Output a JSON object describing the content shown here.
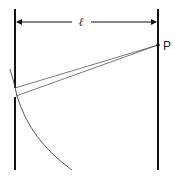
{
  "diagram": {
    "type": "single-slit diffraction geometry",
    "labels": {
      "distance": "ℓ",
      "point": "P"
    },
    "colors": {
      "lines": "#111111",
      "rays": "#555555",
      "arc": "#444444",
      "background": "#ffffff"
    },
    "elements": [
      "left wall with slit",
      "right screen",
      "distance arrow ℓ",
      "two rays from slit edges to P",
      "circular arc centered on P"
    ]
  }
}
